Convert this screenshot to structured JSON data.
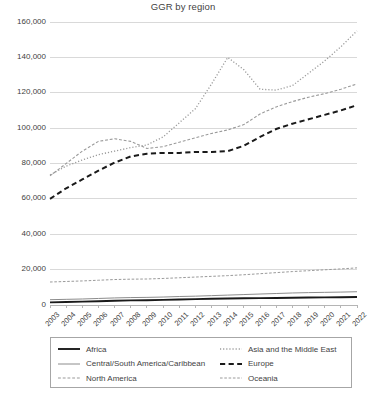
{
  "chart_data": {
    "type": "line",
    "title": "GGR by region",
    "xlabel": "",
    "ylabel": "",
    "ylim": [
      0,
      160000
    ],
    "ytick_step": 20000,
    "grid": true,
    "legend_position": "bottom",
    "x": [
      2003,
      2004,
      2005,
      2006,
      2007,
      2008,
      2009,
      2010,
      2011,
      2012,
      2013,
      2014,
      2015,
      2016,
      2017,
      2018,
      2019,
      2020,
      2021,
      2022
    ],
    "categories": [
      "2003",
      "2004",
      "2005",
      "2006",
      "2007",
      "2008",
      "2009",
      "2010",
      "2011",
      "2012",
      "2013",
      "2014",
      "2015",
      "2016",
      "2017",
      "2018",
      "2019",
      "2020",
      "2021",
      "2022"
    ],
    "ytick_labels": [
      "0",
      "20,000",
      "40,000",
      "60,000",
      "80,000",
      "100,000",
      "120,000",
      "140,000",
      "160,000"
    ],
    "ytick_values": [
      0,
      20000,
      40000,
      60000,
      80000,
      100000,
      120000,
      140000,
      160000
    ],
    "series": [
      {
        "name": "Africa",
        "style": "solid",
        "color": "#1a1a1a",
        "width": 1.9,
        "values": [
          1500,
          1700,
          1900,
          2100,
          2400,
          2600,
          2700,
          2900,
          3100,
          3300,
          3500,
          3700,
          3800,
          3900,
          4000,
          4100,
          4200,
          4300,
          4400,
          4500
        ]
      },
      {
        "name": "Central/South America/Caribbean",
        "style": "solid",
        "color": "#8c8c8c",
        "width": 1.0,
        "values": [
          3000,
          3200,
          3400,
          3700,
          4000,
          4200,
          4300,
          4500,
          4800,
          5000,
          5300,
          5600,
          5900,
          6200,
          6500,
          6800,
          7000,
          7150,
          7300,
          7500
        ]
      },
      {
        "name": "North America",
        "style": "dashed",
        "color": "#9a9a9a",
        "width": 1.1,
        "values": [
          73000,
          80000,
          87000,
          92500,
          94000,
          92500,
          88500,
          89500,
          92000,
          94500,
          97000,
          99000,
          102000,
          108000,
          112000,
          115000,
          117500,
          119500,
          122000,
          125000
        ]
      },
      {
        "name": "Asia and the Middle East",
        "style": "dotted",
        "color": "#9a9a9a",
        "width": 1.3,
        "values": [
          73500,
          78500,
          82000,
          85000,
          87000,
          89000,
          90500,
          95000,
          103000,
          111000,
          125000,
          140000,
          133000,
          122000,
          121500,
          124000,
          131000,
          138000,
          146000,
          155000
        ]
      },
      {
        "name": "Europe",
        "style": "dashed",
        "color": "#1a1a1a",
        "width": 2.0,
        "values": [
          60000,
          66000,
          71000,
          76000,
          80500,
          84000,
          85500,
          86000,
          86000,
          86500,
          86500,
          87000,
          90000,
          95000,
          99500,
          102500,
          105000,
          107500,
          110000,
          113000
        ]
      },
      {
        "name": "Oceania",
        "style": "dashed",
        "color": "#9a9a9a",
        "width": 1.0,
        "values": [
          13000,
          13300,
          13600,
          14000,
          14400,
          14600,
          14700,
          15000,
          15400,
          15800,
          16200,
          16600,
          17100,
          17700,
          18300,
          18900,
          19400,
          19900,
          20400,
          21000
        ]
      }
    ]
  },
  "legend": {
    "left_column": [
      {
        "label": "Africa",
        "series": "Africa"
      },
      {
        "label": "Central/South America/Caribbean",
        "series": "Central/South America/Caribbean"
      },
      {
        "label": "North America",
        "series": "North America"
      }
    ],
    "right_column": [
      {
        "label": "Asia and the Middle East",
        "series": "Asia and the Middle East"
      },
      {
        "label": "Europe",
        "series": "Europe"
      },
      {
        "label": "Oceania",
        "series": "Oceania"
      }
    ]
  }
}
